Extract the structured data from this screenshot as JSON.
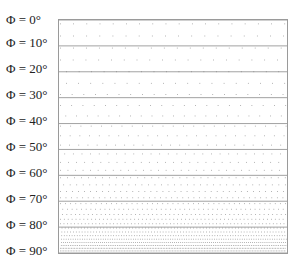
{
  "figure": {
    "symbol": "Φ",
    "labels": [
      {
        "text": "Φ = 0°",
        "angle": 0
      },
      {
        "text": "Φ = 10°",
        "angle": 10
      },
      {
        "text": "Φ = 20°",
        "angle": 20
      },
      {
        "text": "Φ = 30°",
        "angle": 30
      },
      {
        "text": "Φ = 40°",
        "angle": 40
      },
      {
        "text": "Φ = 50°",
        "angle": 50
      },
      {
        "text": "Φ = 60°",
        "angle": 60
      },
      {
        "text": "Φ = 70°",
        "angle": 70
      },
      {
        "text": "Φ = 80°",
        "angle": 80
      },
      {
        "text": "Φ = 90°",
        "angle": 90
      }
    ],
    "l0": "Φ = 0°",
    "l1": "Φ = 10°",
    "l2": "Φ = 20°",
    "l3": "Φ = 30°",
    "l4": "Φ = 40°",
    "l5": "Φ = 50°",
    "l6": "Φ = 60°",
    "l7": "Φ = 70°",
    "l8": "Φ = 80°",
    "l9": "Φ = 90°",
    "colors": {
      "frame": "#9a9a9a",
      "dots": "#8c8c8c",
      "band_line": "#7a7a7a",
      "text": "#222222"
    },
    "caption": "…"
  }
}
